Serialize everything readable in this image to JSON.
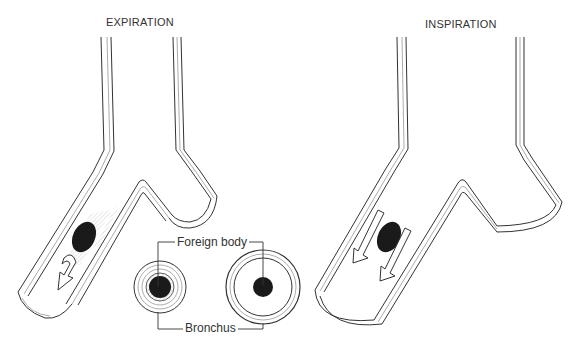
{
  "diagram": {
    "panels": [
      {
        "id": "expiration",
        "title": "EXPIRATION"
      },
      {
        "id": "inspiration",
        "title": "INSPIRATION"
      }
    ],
    "labels": {
      "foreign_body": "Foreign body",
      "bronchus": "Bronchus"
    },
    "colors": {
      "ink": "#333333",
      "foreign_body": "#1a1a1a",
      "wall_shade": "#d8d8d8"
    }
  }
}
